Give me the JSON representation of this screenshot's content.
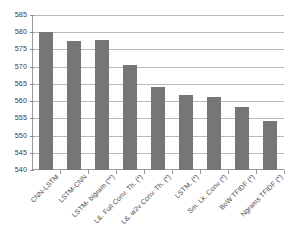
{
  "chart_data": {
    "type": "bar",
    "title": "",
    "xlabel": "",
    "ylabel": "",
    "ylim": [
      540,
      585
    ],
    "ytick_step": 5,
    "yticks": [
      585,
      580,
      575,
      570,
      565,
      560,
      555,
      550,
      545,
      540
    ],
    "grid": true,
    "legend": "none",
    "bar_color": "#767676",
    "categories": [
      "CNN-LSTM",
      "LSTM-CNN",
      "LSTM- bigram (**)",
      "L&. Full Conv. Th. (*)",
      "L&. w2v Conv. Th. (*)",
      "LSTM. (*)",
      "Sm. Lk. Conv (*)",
      "BoW TFIDF (*)",
      "Ngrams TFIDF (*)"
    ],
    "values": [
      580.2,
      577.5,
      577.8,
      570.6,
      564.0,
      561.8,
      561.1,
      558.2,
      554.3
    ]
  }
}
